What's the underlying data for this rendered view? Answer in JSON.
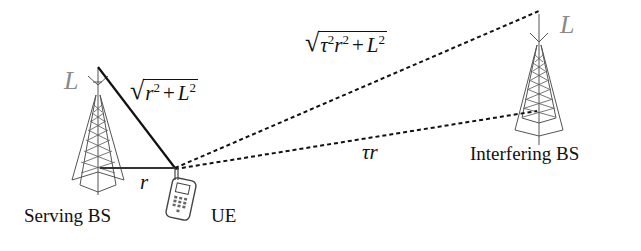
{
  "diagram": {
    "type": "interference-geometry",
    "nodes": {
      "serving_bs": {
        "label": "Serving BS",
        "height_label": "L"
      },
      "interfering_bs": {
        "label": "Interfering BS",
        "height_label": "L"
      },
      "ue": {
        "label": "UE"
      }
    },
    "edges": {
      "serving_horizontal": {
        "label": "r",
        "style": "solid"
      },
      "serving_slant": {
        "label_base": "r",
        "label_exp": "2",
        "label_op": "+",
        "label_term": "L",
        "label_term_exp": "2",
        "style": "solid"
      },
      "interfering_horizontal": {
        "label": "τr",
        "style": "dashed"
      },
      "interfering_slant": {
        "label_a": "τ",
        "label_a_exp": "2",
        "label_b": "r",
        "label_b_exp": "2",
        "label_op": "+",
        "label_term": "L",
        "label_term_exp": "2",
        "style": "dashed"
      }
    },
    "colors": {
      "line": "#111111",
      "tower": "#555555",
      "height_label": "#8a8a8a"
    }
  }
}
